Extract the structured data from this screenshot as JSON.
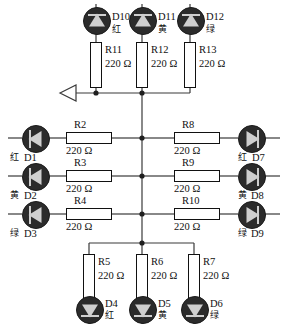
{
  "diagram": {
    "resistance_value": "220 Ω",
    "colors": {
      "wire": "#3a3a3a",
      "led_body": "#2b2b2b",
      "led_symbol": "#cfcfcf",
      "resistor_fill": "#ffffff",
      "text": "#111111",
      "background": "#ffffff"
    },
    "source_marker": {
      "name": "input-arrow",
      "shape": "hollow-left-triangle"
    }
  },
  "top_branch": {
    "leds": [
      {
        "refdes": "D10",
        "color_cn": "红",
        "color_en": "red",
        "orientation": "up"
      },
      {
        "refdes": "D11",
        "color_cn": "黄",
        "color_en": "yellow",
        "orientation": "up"
      },
      {
        "refdes": "D12",
        "color_cn": "绿",
        "color_en": "green",
        "orientation": "up"
      }
    ],
    "resistors": [
      {
        "refdes": "R11",
        "value": "220 Ω"
      },
      {
        "refdes": "R12",
        "value": "220 Ω"
      },
      {
        "refdes": "R13",
        "value": "220 Ω"
      }
    ]
  },
  "left_branch": {
    "leds": [
      {
        "refdes": "D1",
        "color_cn": "红",
        "color_en": "red",
        "orientation": "left"
      },
      {
        "refdes": "D2",
        "color_cn": "黄",
        "color_en": "yellow",
        "orientation": "left"
      },
      {
        "refdes": "D3",
        "color_cn": "绿",
        "color_en": "green",
        "orientation": "left"
      }
    ],
    "resistors": [
      {
        "refdes": "R2",
        "value": "220 Ω"
      },
      {
        "refdes": "R3",
        "value": "220 Ω"
      },
      {
        "refdes": "R4",
        "value": "220 Ω"
      }
    ]
  },
  "right_branch": {
    "leds": [
      {
        "refdes": "D7",
        "color_cn": "红",
        "color_en": "red",
        "orientation": "right"
      },
      {
        "refdes": "D8",
        "color_cn": "黄",
        "color_en": "yellow",
        "orientation": "right"
      },
      {
        "refdes": "D9",
        "color_cn": "绿",
        "color_en": "green",
        "orientation": "right"
      }
    ],
    "resistors": [
      {
        "refdes": "R8",
        "value": "220 Ω"
      },
      {
        "refdes": "R9",
        "value": "220 Ω"
      },
      {
        "refdes": "R10",
        "value": "220 Ω"
      }
    ]
  },
  "bottom_branch": {
    "leds": [
      {
        "refdes": "D4",
        "color_cn": "红",
        "color_en": "red",
        "orientation": "down"
      },
      {
        "refdes": "D5",
        "color_cn": "黄",
        "color_en": "yellow",
        "orientation": "down"
      },
      {
        "refdes": "D6",
        "color_cn": "绿",
        "color_en": "green",
        "orientation": "down"
      }
    ],
    "resistors": [
      {
        "refdes": "R5",
        "value": "220 Ω"
      },
      {
        "refdes": "R6",
        "value": "220 Ω"
      },
      {
        "refdes": "R7",
        "value": "220 Ω"
      }
    ]
  }
}
